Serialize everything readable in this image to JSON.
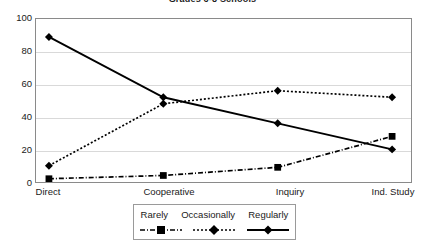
{
  "chart_data": {
    "type": "line",
    "title": "Grades 6-8 Schools",
    "xlabel": "",
    "ylabel": "",
    "categories": [
      "Direct",
      "Cooperative",
      "Inquiry",
      "Ind. Study"
    ],
    "series": [
      {
        "name": "Rarely",
        "values": [
          2,
          4,
          9,
          28
        ],
        "line_style": "dash-dot",
        "marker": "square",
        "color": "#000000"
      },
      {
        "name": "Occasionally",
        "values": [
          10,
          48,
          56,
          52
        ],
        "line_style": "dotted",
        "marker": "diamond",
        "color": "#000000"
      },
      {
        "name": "Regularly",
        "values": [
          89,
          52,
          36,
          20
        ],
        "line_style": "solid",
        "marker": "diamond",
        "color": "#000000"
      }
    ],
    "ylim": [
      0,
      100
    ],
    "y_ticks": [
      0,
      20,
      40,
      60,
      80,
      100
    ],
    "y_tick_labels": [
      "0",
      "20",
      "40",
      "60",
      "80",
      "100"
    ],
    "grid": true,
    "grid_axis": "y",
    "legend_position": "bottom",
    "plot_border_color": "#8a8a8a",
    "gridline_color": "#d9d9d9",
    "background": "#ffffff"
  }
}
